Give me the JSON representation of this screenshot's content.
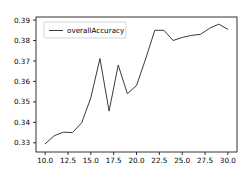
{
  "chart_data": {
    "type": "line",
    "title": "",
    "xlabel": "",
    "ylabel": "",
    "xlim": [
      9.0,
      31.0
    ],
    "ylim": [
      0.3255,
      0.3915
    ],
    "grid": false,
    "legend_position": "upper left",
    "xticks": [
      "10.0",
      "12.5",
      "15.0",
      "17.5",
      "20.0",
      "22.5",
      "25.0",
      "27.5",
      "30.0"
    ],
    "xtick_values": [
      10.0,
      12.5,
      15.0,
      17.5,
      20.0,
      22.5,
      25.0,
      27.5,
      30.0
    ],
    "yticks": [
      "0.33",
      "0.34",
      "0.35",
      "0.36",
      "0.37",
      "0.38",
      "0.39"
    ],
    "ytick_values": [
      0.33,
      0.34,
      0.35,
      0.36,
      0.37,
      0.38,
      0.39
    ],
    "x": [
      10,
      11,
      12,
      13,
      14,
      15,
      16,
      17,
      18,
      19,
      20,
      21,
      22,
      23,
      24,
      25,
      26,
      27,
      28,
      29,
      30
    ],
    "series": [
      {
        "name": "overallAccuracy",
        "color": "#3a3a3a",
        "values": [
          0.3295,
          0.3335,
          0.3352,
          0.335,
          0.3398,
          0.352,
          0.3712,
          0.3455,
          0.368,
          0.354,
          0.358,
          0.371,
          0.385,
          0.385,
          0.38,
          0.3815,
          0.3825,
          0.383,
          0.386,
          0.388,
          0.3855
        ]
      }
    ],
    "legend": [
      "overallAccuracy"
    ]
  }
}
